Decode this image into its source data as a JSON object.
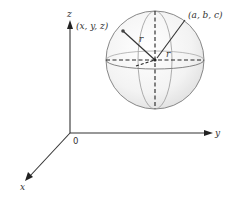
{
  "diagram": {
    "axes": {
      "x_label": "x",
      "y_label": "y",
      "z_label": "z",
      "origin_label": "0"
    },
    "points": {
      "surface_point_label": "(x, y, z)",
      "center_label": "(a, b, c)"
    },
    "radius_labels": {
      "radius_to_point": "r",
      "radius_equatorial": "r"
    },
    "colors": {
      "line": "#333333",
      "sphere_fill": "#f2f2f2",
      "sphere_edge": "#888888"
    }
  }
}
